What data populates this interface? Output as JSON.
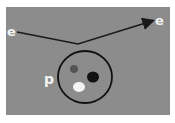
{
  "diagram": {
    "background_color": "#8c8c8c",
    "labels": {
      "incoming_electron": "e",
      "outgoing_electron": "e",
      "proton": "p"
    },
    "proton_quarks": [
      {
        "color": "#555555",
        "role": "quark-gray"
      },
      {
        "color": "#111111",
        "role": "quark-black"
      },
      {
        "color": "#f5f5f5",
        "role": "quark-white"
      }
    ]
  }
}
